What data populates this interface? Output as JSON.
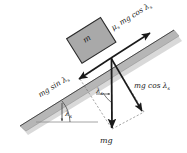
{
  "figure": {
    "kind": "free-body-diagram",
    "background_color": "#ffffff",
    "ink_color": "#1a1a1a",
    "incline_fill": "#b4b4b4",
    "incline_shadow_fill": "#d8d8d8",
    "block_fill": "#a8a8a8",
    "block_stroke": "#2b2b2b"
  },
  "labels": {
    "block_mass": "m",
    "friction_force": "μₛ mg cos λₛ",
    "friction_force_parts": {
      "mu": "μ",
      "mu_sub": "s",
      "mid": " mg cos ",
      "lambda": "λ",
      "lambda_sub": "s"
    },
    "along_incline": "mg sin λₛ",
    "along_incline_parts": {
      "mid": "mg sin ",
      "lambda": "λ",
      "lambda_sub": "s"
    },
    "normal_component": "mg cos λₛ",
    "normal_component_parts": {
      "mid": "mg cos ",
      "lambda": "λ",
      "lambda_sub": "s"
    },
    "weight": "mg",
    "angle_incline": "λₛ",
    "angle_incline_parts": {
      "lambda": "λ",
      "lambda_sub": "s"
    },
    "angle_vector": "λₛ",
    "angle_vector_parts": {
      "lambda": "λ",
      "lambda_sub": "s"
    }
  },
  "geometry": {
    "origin": {
      "x": 111,
      "y": 58
    },
    "friction_tip": {
      "x": 152,
      "y": 32
    },
    "along_incline_tip": {
      "x": 77,
      "y": 78
    },
    "weight_tip": {
      "x": 112,
      "y": 130
    },
    "normal_component_tip": {
      "x": 144,
      "y": 113
    },
    "incline_angle_deg": 32,
    "horizontal_line": {
      "x1": 38,
      "y1": 121,
      "x2": 96,
      "y2": 121
    }
  }
}
